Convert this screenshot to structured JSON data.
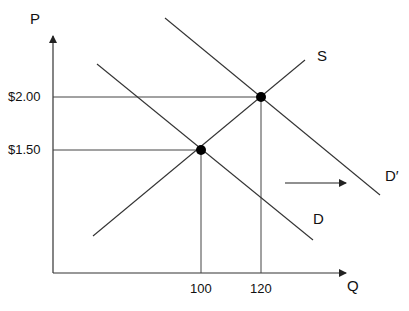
{
  "diagram": {
    "type": "supply-demand",
    "axes": {
      "y_label": "P",
      "x_label": "Q"
    },
    "price_ticks": [
      {
        "label": "$2.00",
        "y": 97
      },
      {
        "label": "$1.50",
        "y": 150
      }
    ],
    "quantity_ticks": [
      {
        "label": "100",
        "x": 201
      },
      {
        "label": "120",
        "x": 261
      }
    ],
    "curves": {
      "supply": {
        "label": "S"
      },
      "demand": {
        "label": "D"
      },
      "demand_shifted": {
        "label": "D′"
      }
    },
    "equilibria": [
      {
        "price": "$1.50",
        "quantity": "100"
      },
      {
        "price": "$2.00",
        "quantity": "120"
      }
    ],
    "shift_arrow": {
      "direction": "right"
    }
  },
  "colors": {
    "line": "#333333",
    "point": "#000000",
    "text": "#111111"
  }
}
